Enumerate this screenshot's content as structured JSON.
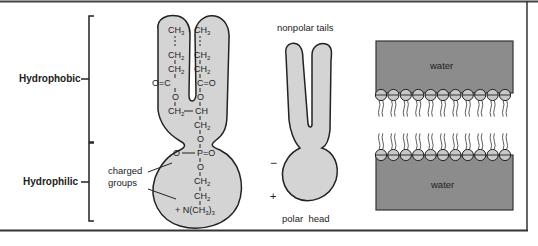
{
  "labels": {
    "hydrophobic": "Hydrophobic",
    "hydrophilic": "Hydrophilic",
    "charged_groups_line1": "charged",
    "charged_groups_line2": "groups",
    "nonpolar_tails": "nonpolar tails",
    "polar_head": "polar  head",
    "minus": "−",
    "plus": "+",
    "water_top": "water",
    "water_bottom": "water"
  },
  "molecule": {
    "left_chain": [
      "CH3",
      "CH2",
      "CH2",
      "O=C",
      "O",
      "CH2"
    ],
    "right_chain": [
      "CH3",
      "CH2",
      "CH2",
      "C=O",
      "O",
      "CH"
    ],
    "backbone": [
      "CH2",
      "O",
      "O−P=O",
      "O",
      "CH2",
      "CH2",
      "+N(CH3)3"
    ]
  },
  "bilayer": {
    "heads_per_row": 11
  },
  "colors": {
    "molecule_fill": "#d4d4d4",
    "water_fill": "#8c8c8c",
    "head_fill": "#c8c8c8",
    "outline": "#222222",
    "frame": "#333333"
  }
}
